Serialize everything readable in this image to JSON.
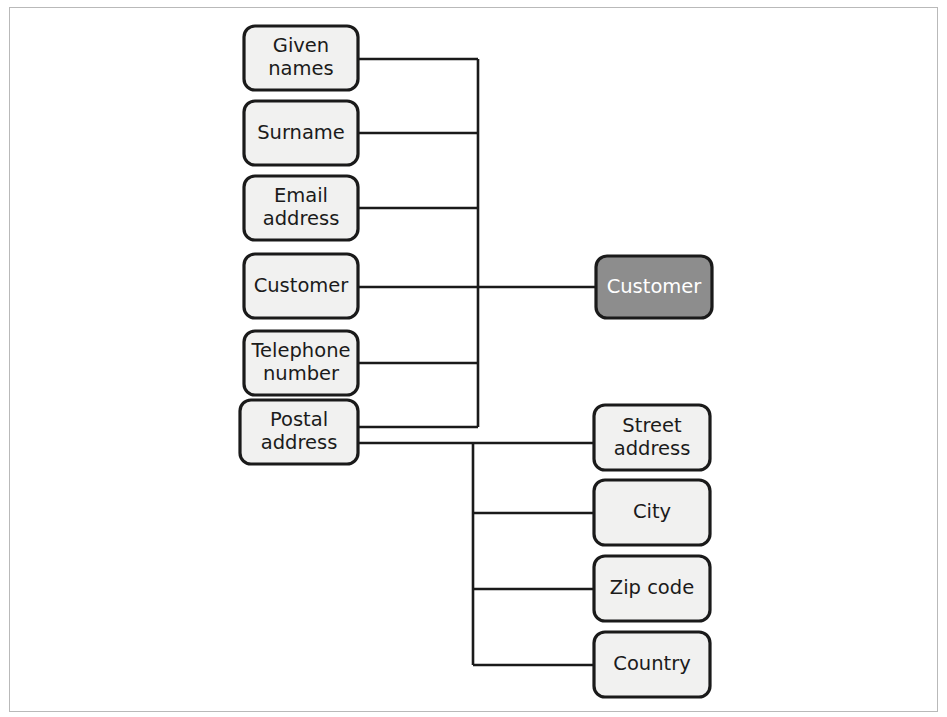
{
  "figure": {
    "background_color": "#ffffff",
    "frame_color": "#b9b9b9"
  },
  "style": {
    "box_fill": "#f1f1f0",
    "box_stroke": "#1a1a1a",
    "highlight_fill": "#8d8d8d",
    "highlight_text": "#ffffff",
    "text_color": "#1b1b1b",
    "connector_color": "#1a1a1a"
  },
  "diagram": {
    "type": "tree",
    "root": {
      "id": "customer-root",
      "label": "Customer",
      "highlighted": true,
      "x": 596,
      "y": 256,
      "width": 116,
      "height": 62
    },
    "attribute_nodes": [
      {
        "id": "given-names",
        "label_lines": [
          "Given",
          "names"
        ],
        "label": "Given names",
        "x": 244,
        "y": 26,
        "width": 114,
        "height": 64,
        "stub_y": 59
      },
      {
        "id": "surname",
        "label_lines": [
          "Surname"
        ],
        "label": "Surname",
        "x": 244,
        "y": 101,
        "width": 114,
        "height": 64,
        "stub_y": 133
      },
      {
        "id": "email-address",
        "label_lines": [
          "Email",
          "address"
        ],
        "label": "Email address",
        "x": 244,
        "y": 176,
        "width": 114,
        "height": 64,
        "stub_y": 208
      },
      {
        "id": "customer-attr",
        "label_lines": [
          "Customer"
        ],
        "label": "Customer",
        "x": 244,
        "y": 254,
        "width": 114,
        "height": 64,
        "stub_y": 287
      },
      {
        "id": "telephone-number",
        "label_lines": [
          "Telephone",
          "number"
        ],
        "label": "Telephone number",
        "x": 244,
        "y": 331,
        "width": 114,
        "height": 64,
        "stub_y": 363
      },
      {
        "id": "postal-address",
        "label_lines": [
          "Postal",
          "address"
        ],
        "label": "Postal address",
        "x": 240,
        "y": 400,
        "width": 118,
        "height": 64,
        "stub_y": 427
      }
    ],
    "address_nodes": [
      {
        "id": "street-address",
        "label_lines": [
          "Street",
          "address"
        ],
        "label": "Street address",
        "x": 594,
        "y": 405,
        "width": 116,
        "height": 65,
        "stub_y": 443
      },
      {
        "id": "city",
        "label_lines": [
          "City"
        ],
        "label": "City",
        "x": 594,
        "y": 480,
        "width": 116,
        "height": 65,
        "stub_y": 513
      },
      {
        "id": "zip-code",
        "label_lines": [
          "Zip code"
        ],
        "label": "Zip code",
        "x": 594,
        "y": 556,
        "width": 116,
        "height": 65,
        "stub_y": 589
      },
      {
        "id": "country",
        "label_lines": [
          "Country"
        ],
        "label": "Country",
        "x": 594,
        "y": 632,
        "width": 116,
        "height": 65,
        "stub_y": 665
      }
    ],
    "connectors": {
      "attribute_spine_x": 478,
      "attribute_spine_top": 59,
      "attribute_spine_bottom": 427,
      "attribute_stub_left": 358,
      "root_line_y": 287,
      "root_line_left": 358,
      "root_line_right": 596,
      "postal_branch_y": 443,
      "postal_branch_left": 358,
      "postal_branch_right": 594,
      "address_spine_x": 473,
      "address_spine_top": 443,
      "address_spine_bottom": 665,
      "address_stub_right": 594
    }
  }
}
